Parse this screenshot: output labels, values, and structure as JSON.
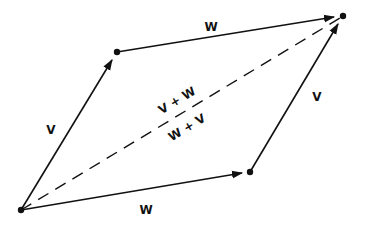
{
  "diagram": {
    "labels": {
      "top_edge": "W",
      "bottom_edge": "W",
      "left_edge": "V",
      "right_edge": "V",
      "diagonal_upper": "V + W",
      "diagonal_lower": "W + V"
    },
    "colors": {
      "ink": "#111111",
      "background": "#ffffff"
    }
  }
}
